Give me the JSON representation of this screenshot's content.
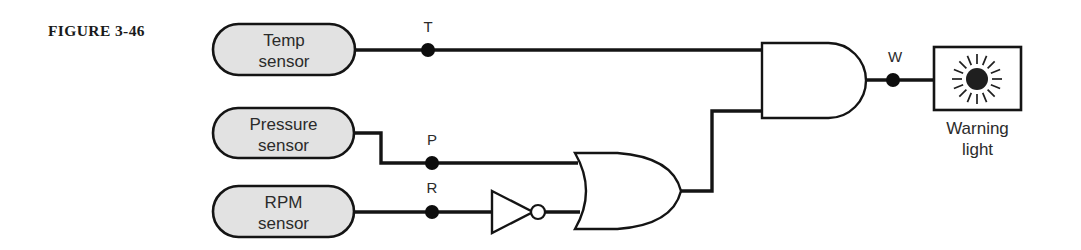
{
  "figure": {
    "caption": "FIGURE 3-46",
    "caption_x": 48,
    "caption_y": 36
  },
  "sensors": [
    {
      "id": "temp",
      "line1": "Temp",
      "line2": "sensor",
      "x": 213,
      "y": 24,
      "width": 142,
      "height": 51,
      "output_signal": "T"
    },
    {
      "id": "pressure",
      "line1": "Pressure",
      "line2": "sensor",
      "x": 213,
      "y": 108,
      "width": 141,
      "height": 50,
      "output_signal": "P"
    },
    {
      "id": "rpm",
      "line1": "RPM",
      "line2": "sensor",
      "x": 213,
      "y": 186,
      "width": 141,
      "height": 51,
      "output_signal": "R"
    }
  ],
  "signals": [
    {
      "name": "T",
      "label_x": 428,
      "label_y": 32,
      "dot_x": 428,
      "dot_y": 50
    },
    {
      "name": "P",
      "label_x": 432,
      "label_y": 145,
      "dot_x": 432,
      "dot_y": 163
    },
    {
      "name": "R",
      "label_x": 432,
      "label_y": 193,
      "dot_x": 432,
      "dot_y": 212
    },
    {
      "name": "W",
      "label_x": 895,
      "label_y": 62,
      "dot_x": 893,
      "dot_y": 80
    }
  ],
  "gates": [
    {
      "id": "not-gate",
      "type": "NOT",
      "name": "inverter",
      "x": 492,
      "y": 191,
      "width": 41,
      "height": 42,
      "bubble_cx": 538,
      "bubble_cy": 212,
      "bubble_r": 7
    },
    {
      "id": "or-gate",
      "type": "OR",
      "name": "or-gate",
      "x": 575,
      "y": 153,
      "width": 106,
      "height": 76
    },
    {
      "id": "and-gate",
      "type": "AND",
      "name": "and-gate",
      "x": 762,
      "y": 43,
      "width": 104,
      "height": 75
    }
  ],
  "output_device": {
    "id": "warning-light",
    "line1": "Warning",
    "line2": "light",
    "box_x": 934,
    "box_y": 47,
    "box_width": 87,
    "box_height": 63,
    "icon": "sun-burst-icon",
    "icon_cx": 977,
    "icon_cy": 79,
    "core_r": 11,
    "ray_count": 16,
    "ray_inner": 15,
    "ray_outer": 25
  },
  "wires": [
    {
      "name": "temp-to-and",
      "path": "M 355 50 L 766 50"
    },
    {
      "name": "pressure-to-or",
      "path": "M 354 133 L 381 133 L 381 163 L 578 163"
    },
    {
      "name": "rpm-to-not",
      "path": "M 354 212 L 492 212"
    },
    {
      "name": "not-to-or",
      "path": "M 545 212 L 580 212"
    },
    {
      "name": "or-to-and",
      "path": "M 681 191 L 712 191 L 712 111 L 766 111"
    },
    {
      "name": "and-to-lamp",
      "path": "M 866 80 L 934 80"
    }
  ],
  "colors": {
    "stroke": "#141414",
    "capsule_fill": "#e2e2e2",
    "gate_fill": "#ffffff",
    "background": "#ffffff",
    "text": "#2b2b2b"
  }
}
